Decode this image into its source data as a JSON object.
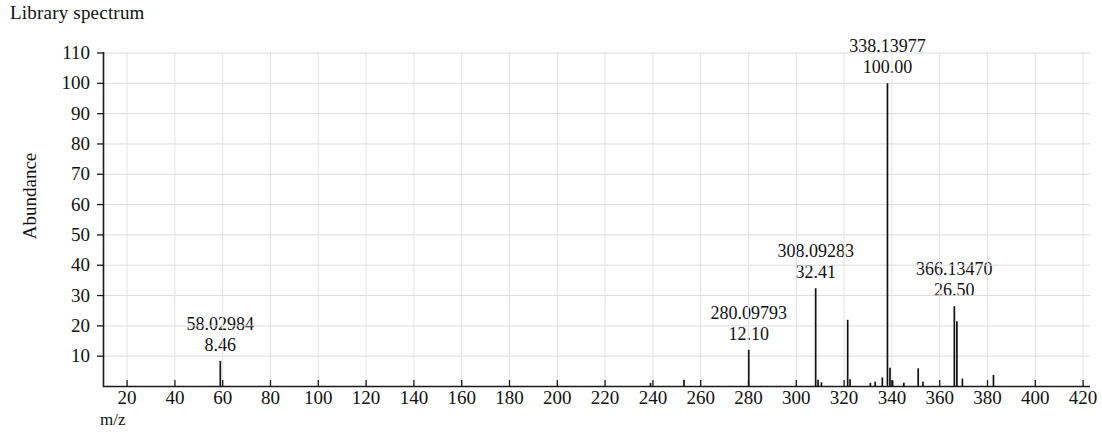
{
  "chart_title": "Library spectrum",
  "axis": {
    "y_title": "Abundance",
    "x_title": "m/z",
    "y_ticks": [
      10,
      20,
      30,
      40,
      50,
      60,
      70,
      80,
      90,
      100,
      110
    ],
    "x_ticks": [
      20,
      40,
      60,
      80,
      100,
      120,
      140,
      160,
      180,
      200,
      220,
      240,
      260,
      280,
      300,
      320,
      340,
      360,
      380,
      400,
      420
    ]
  },
  "annotations": [
    {
      "mz": "58.02984",
      "intensity": "8.46",
      "x": 59.0,
      "y": 8.46
    },
    {
      "mz": "280.09793",
      "intensity": "12.10",
      "x": 280.1,
      "y": 12.1
    },
    {
      "mz": "308.09283",
      "intensity": "32.41",
      "x": 308.1,
      "y": 32.41
    },
    {
      "mz": "338.13977",
      "intensity": "100.00",
      "x": 338.14,
      "y": 100.0
    },
    {
      "mz": "366.13470",
      "intensity": "26.50",
      "x": 366.13,
      "y": 26.5
    }
  ],
  "chart_data": {
    "type": "bar",
    "title": "Library spectrum",
    "xlabel": "m/z",
    "ylabel": "Abundance",
    "xlim": [
      10,
      428
    ],
    "ylim": [
      0,
      113
    ],
    "grid": true,
    "legend": "none",
    "x": [
      59.0,
      239.0,
      253.0,
      280.1,
      308.1,
      309.1,
      310.5,
      321.5,
      322.5,
      331.0,
      333.0,
      336.0,
      338.14,
      339.2,
      340.3,
      345.0,
      351.0,
      353.0,
      366.13,
      367.2,
      369.5,
      382.5
    ],
    "y": [
      8.46,
      1.2,
      2.2,
      12.1,
      32.41,
      2.2,
      1.4,
      22.0,
      2.4,
      1.2,
      1.6,
      3.0,
      100.0,
      6.2,
      2.0,
      1.2,
      6.0,
      1.6,
      26.5,
      21.5,
      2.6,
      3.8
    ],
    "labeled_peaks": [
      {
        "mz": 58.02984,
        "relative_intensity": 8.46
      },
      {
        "mz": 280.09793,
        "relative_intensity": 12.1
      },
      {
        "mz": 308.09283,
        "relative_intensity": 32.41
      },
      {
        "mz": 338.13977,
        "relative_intensity": 100.0
      },
      {
        "mz": 366.1347,
        "relative_intensity": 26.5
      }
    ]
  }
}
